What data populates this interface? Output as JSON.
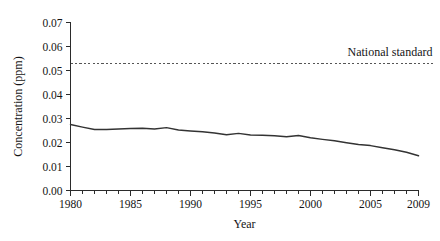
{
  "chart_data": {
    "type": "line",
    "title": "",
    "subtitle": "",
    "xlabel": "Year",
    "ylabel": "Concentration (ppm)",
    "xlim": [
      1980,
      2009
    ],
    "ylim": [
      0.0,
      0.07
    ],
    "grid": false,
    "legend_position": "none",
    "x_tick_labels": [
      "1980",
      "1985",
      "1990",
      "1995",
      "2000",
      "2005",
      "2009"
    ],
    "x_tick_values": [
      1980,
      1985,
      1990,
      1995,
      2000,
      2005,
      2009
    ],
    "x_minor_tick_step": 1,
    "y_tick_labels": [
      "0.00",
      "0.01",
      "0.02",
      "0.03",
      "0.04",
      "0.05",
      "0.06",
      "0.07"
    ],
    "y_tick_values": [
      0.0,
      0.01,
      0.02,
      0.03,
      0.04,
      0.05,
      0.06,
      0.07
    ],
    "x": [
      1980,
      1981,
      1982,
      1983,
      1984,
      1985,
      1986,
      1987,
      1988,
      1989,
      1990,
      1991,
      1992,
      1993,
      1994,
      1995,
      1996,
      1997,
      1998,
      1999,
      2000,
      2001,
      2002,
      2003,
      2004,
      2005,
      2006,
      2007,
      2008,
      2009
    ],
    "series": [
      {
        "name": "Concentration",
        "color": "#333333",
        "style": "solid",
        "values": [
          0.0275,
          0.0264,
          0.0254,
          0.0254,
          0.0256,
          0.0258,
          0.0259,
          0.0256,
          0.0262,
          0.0252,
          0.0248,
          0.0245,
          0.024,
          0.0232,
          0.0238,
          0.0231,
          0.023,
          0.0228,
          0.0224,
          0.0229,
          0.022,
          0.0213,
          0.0207,
          0.0199,
          0.0192,
          0.0187,
          0.0178,
          0.017,
          0.0159,
          0.0145
        ]
      }
    ],
    "annotations": [
      {
        "name": "national-standard",
        "label": "National standard",
        "type": "hline",
        "value": 0.053,
        "color": "#555555",
        "style": "dashed",
        "label_x": 2009,
        "label_position": "above-right"
      }
    ]
  },
  "figure": {
    "background_color": "#ffffff",
    "axis_color": "#2b2b2b",
    "text_color": "#151515"
  }
}
